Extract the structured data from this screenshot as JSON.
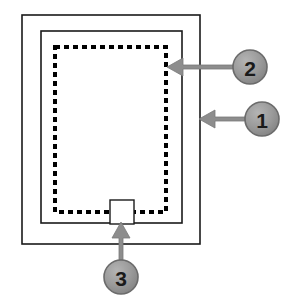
{
  "diagram": {
    "type": "exploded-callout-technical-drawing",
    "canvas": {
      "width": 283,
      "height": 306,
      "background": "#ffffff"
    },
    "colors": {
      "outline": "#1a1a1a",
      "dashed_outline": "#000000",
      "callout_fill": "#8d8d8d",
      "callout_fill_light": "#a9a9a9",
      "callout_stroke": "#6b6b6b",
      "callout_text": "#1a1a1a",
      "arrow": "#8d8d8d",
      "arrow_stroke": "#7a7a7a",
      "panel_fill": "#ffffff"
    },
    "shapes": {
      "outer_frame": {
        "name": "outer-frame-rectangle",
        "x": 22,
        "y": 15,
        "width": 178,
        "height": 229,
        "stroke_width": 1.6,
        "style": "solid"
      },
      "middle_frame": {
        "name": "middle-frame-rectangle",
        "x": 41,
        "y": 31,
        "width": 141,
        "height": 192,
        "stroke_width": 1.6,
        "style": "solid"
      },
      "inner_frame": {
        "name": "inner-dashed-rectangle",
        "x": 55,
        "y": 47,
        "width": 111,
        "height": 165,
        "stroke_width": 4,
        "style": "dashed",
        "dash_pattern": "5 4"
      },
      "latch_box": {
        "name": "latch-detail-rectangle",
        "x": 110,
        "y": 200,
        "width": 24,
        "height": 24,
        "stroke_width": 1.4,
        "style": "solid"
      }
    },
    "callouts": [
      {
        "id": "callout-1",
        "label": "1",
        "circle": {
          "cx": 262,
          "cy": 119,
          "r": 17
        },
        "arrow": {
          "direction": "left",
          "tail_x": 245,
          "tip_x": 199,
          "y": 119,
          "shaft_thickness": 4,
          "head_length": 16,
          "head_half_height": 9
        },
        "points_to": "outer-frame-rectangle"
      },
      {
        "id": "callout-2",
        "label": "2",
        "circle": {
          "cx": 250,
          "cy": 67,
          "r": 17
        },
        "arrow": {
          "direction": "left",
          "tail_x": 233,
          "tip_x": 167,
          "y": 67,
          "shaft_thickness": 4,
          "head_length": 16,
          "head_half_height": 9
        },
        "points_to": "inner-dashed-rectangle"
      },
      {
        "id": "callout-3",
        "label": "3",
        "circle": {
          "cx": 121,
          "cy": 277,
          "r": 17
        },
        "arrow": {
          "direction": "up",
          "tail_y": 260,
          "tip_y": 222,
          "x": 121,
          "shaft_thickness": 4,
          "head_length": 16,
          "head_half_height": 9
        },
        "points_to": "latch-detail-rectangle"
      }
    ]
  }
}
